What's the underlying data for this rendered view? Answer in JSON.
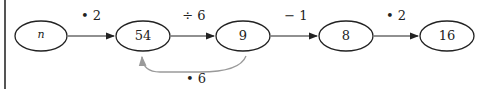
{
  "diagram": {
    "nodes": [
      {
        "id": "n0",
        "label": "n"
      },
      {
        "id": "n1",
        "label": "54"
      },
      {
        "id": "n2",
        "label": "9"
      },
      {
        "id": "n3",
        "label": "8"
      },
      {
        "id": "n4",
        "label": "16"
      }
    ],
    "edges": [
      {
        "from": "n0",
        "to": "n1",
        "label": "• 2"
      },
      {
        "from": "n1",
        "to": "n2",
        "label": "÷ 6"
      },
      {
        "from": "n2",
        "to": "n3",
        "label": "− 1"
      },
      {
        "from": "n3",
        "to": "n4",
        "label": "• 2"
      },
      {
        "from": "n2",
        "to": "n1",
        "label": "• 6",
        "color": "#9a9a9a"
      }
    ]
  }
}
